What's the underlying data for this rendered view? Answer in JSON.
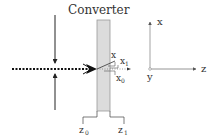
{
  "diagram": {
    "title": "Converter",
    "converter": {
      "fill_color": "#dcdcdc",
      "border_color": "#9a9a9a",
      "left_boundary_label": "z",
      "left_boundary_sub": "0",
      "right_boundary_label": "z",
      "right_boundary_sub": "1"
    },
    "beam": {
      "style": "dotted",
      "color": "#111111"
    },
    "position_labels": {
      "x": "x",
      "x1": "x",
      "x1_sub": "1",
      "x0": "x",
      "x0_sub": "0"
    },
    "axes": {
      "x_label": "x",
      "y_label": "y",
      "z_label": "z",
      "color": "#555555"
    },
    "focusing_arrows": {
      "count": 2,
      "directions": [
        "down",
        "up"
      ]
    }
  }
}
